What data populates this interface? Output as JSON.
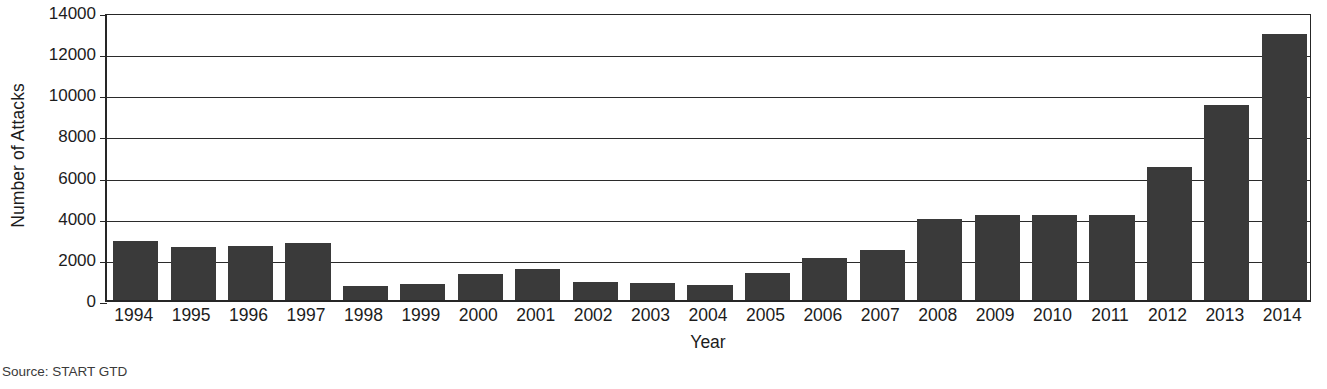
{
  "chart_data": {
    "type": "bar",
    "title": "",
    "xlabel": "Year",
    "ylabel": "Number of Attacks",
    "categories": [
      "1994",
      "1995",
      "1996",
      "1997",
      "1998",
      "1999",
      "2000",
      "2001",
      "2002",
      "2003",
      "2004",
      "2005",
      "2006",
      "2007",
      "2008",
      "2009",
      "2010",
      "2011",
      "2012",
      "2013",
      "2014"
    ],
    "values": [
      2850,
      2600,
      2650,
      2750,
      700,
      800,
      1250,
      1500,
      900,
      850,
      750,
      1300,
      2050,
      2450,
      3950,
      4150,
      4150,
      4150,
      6450,
      9500,
      12950
    ],
    "series": [
      {
        "name": "Number of Attacks",
        "values": [
          2850,
          2600,
          2650,
          2750,
          700,
          800,
          1250,
          1500,
          900,
          850,
          750,
          1300,
          2050,
          2450,
          3950,
          4150,
          4150,
          4150,
          6450,
          9500,
          12950
        ]
      }
    ],
    "ylim": [
      0,
      14000
    ],
    "yticks": [
      0,
      2000,
      4000,
      6000,
      8000,
      10000,
      12000,
      14000
    ],
    "ytick_labels": [
      "0",
      "2000",
      "4000",
      "6000",
      "8000",
      "10000",
      "12000",
      "14000"
    ],
    "grid": true,
    "grid_axis": "y",
    "legend": null,
    "legend_position": "none",
    "bar_color": "#3a3a3a",
    "axis_color": "#262626",
    "background_color": "#ffffff"
  },
  "footer": {
    "source": "Source: START GTD"
  }
}
